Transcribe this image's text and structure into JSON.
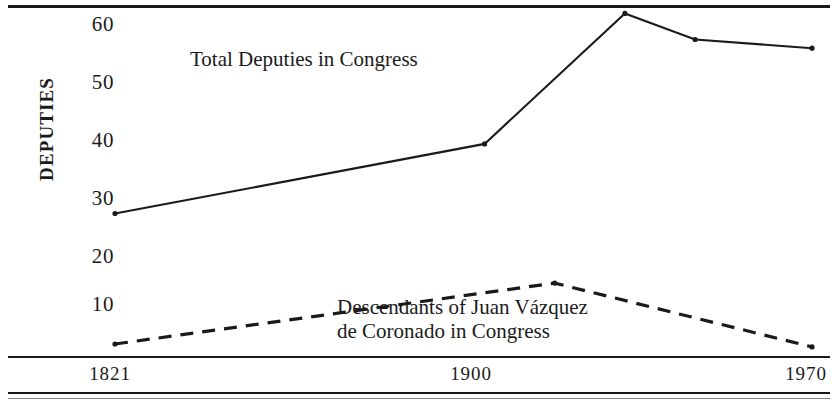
{
  "chart_data": {
    "type": "line",
    "title": "",
    "xlabel": "",
    "ylabel": "DEPUTIES",
    "x": [
      1821,
      1900,
      1970
    ],
    "xticks": [
      "1821",
      "1900",
      "1970"
    ],
    "yticks": [
      "10",
      "20",
      "30",
      "40",
      "50",
      "60"
    ],
    "ylim": [
      0,
      65
    ],
    "xlim": [
      1821,
      1970
    ],
    "grid": false,
    "legend": "in-plot annotations",
    "series": [
      {
        "name": "Total Deputies in Congress",
        "style": "solid",
        "points": [
          {
            "x": 1821,
            "y": 27.5
          },
          {
            "x": 1900,
            "y": 39.5
          },
          {
            "x": 1930,
            "y": 62.0
          },
          {
            "x": 1945,
            "y": 57.5
          },
          {
            "x": 1970,
            "y": 56.0
          }
        ]
      },
      {
        "name": "Descendants of Juan Vázquez de Coronado in Congress",
        "style": "dashed",
        "points": [
          {
            "x": 1821,
            "y": 5.0
          },
          {
            "x": 1915,
            "y": 15.5
          },
          {
            "x": 1970,
            "y": 4.5
          }
        ]
      }
    ],
    "annotations": [
      {
        "id": "label-total",
        "text": "Total Deputies in Congress"
      },
      {
        "id": "label-descendants-line1",
        "text": "Descendants of Juan Vázquez"
      },
      {
        "id": "label-descendants-line2",
        "text": "de Coronado in Congress"
      }
    ]
  },
  "axis": {
    "y_title": "DEPUTIES",
    "y_ticks": [
      {
        "label": "60",
        "top": 14
      },
      {
        "label": "50",
        "top": 72
      },
      {
        "label": "40",
        "top": 130
      },
      {
        "label": "30",
        "top": 188
      },
      {
        "label": "20",
        "top": 246
      },
      {
        "label": "10",
        "top": 294
      }
    ],
    "x_ticks": [
      {
        "label": "1821",
        "left": 50
      },
      {
        "label": "1900",
        "left": 411
      },
      {
        "label": "1970",
        "left": 746
      }
    ]
  },
  "labels": {
    "total_deputies": "Total Deputies in Congress",
    "descendants_line1": "Descendants of Juan Vázquez",
    "descendants_line2": "de Coronado in Congress"
  },
  "colors": {
    "ink": "#1a1a1a",
    "paper": "#ffffff"
  }
}
